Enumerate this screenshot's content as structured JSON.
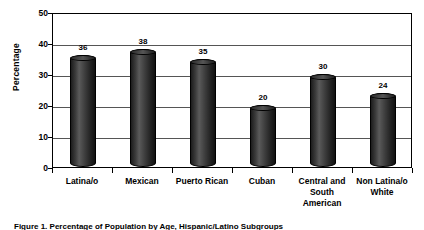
{
  "chart_data": {
    "type": "bar",
    "title": "",
    "xlabel": "",
    "ylabel": "Percentage",
    "ylim": [
      0,
      50
    ],
    "yticks": [
      0,
      10,
      20,
      30,
      40,
      50
    ],
    "grid": true,
    "legend": "none",
    "categories": [
      "Latina/o",
      "Mexican",
      "Puerto Rican",
      "Cuban",
      "Central and South American",
      "Non Latina/o White"
    ],
    "category_lines": [
      [
        "Latina/o"
      ],
      [
        "Mexican"
      ],
      [
        "Puerto Rican"
      ],
      [
        "Cuban"
      ],
      [
        "Central and",
        "South",
        "American"
      ],
      [
        "Non Latina/o",
        "White"
      ]
    ],
    "values": [
      36,
      38,
      35,
      20,
      30,
      24
    ],
    "value_labels": [
      "36",
      "38",
      "35",
      "20",
      "30",
      "24"
    ],
    "series": [
      {
        "name": "Percentage",
        "values": [
          36,
          38,
          35,
          20,
          30,
          24
        ]
      }
    ],
    "bar_color": "#2b2b2b"
  },
  "caption": {
    "text": "Figure 1. Percentage of Population by Age, Hispanic/Latino Subgroups"
  }
}
